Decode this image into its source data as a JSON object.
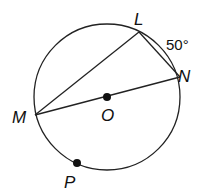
{
  "diagram": {
    "type": "circle-geometry",
    "center": {
      "label": "O",
      "x": 107,
      "y": 97
    },
    "radius": 73,
    "points": [
      {
        "label": "L",
        "x": 139,
        "y": 32
      },
      {
        "label": "N",
        "x": 180,
        "y": 77
      },
      {
        "label": "M",
        "x": 35,
        "y": 115
      },
      {
        "label": "P",
        "x": 77,
        "y": 163
      }
    ],
    "segments": [
      "ML",
      "LN",
      "MN"
    ],
    "arc_label": {
      "arc": "LN",
      "text": "50°"
    },
    "colors": {
      "stroke": "#222222",
      "text": "#111111",
      "background": "#ffffff"
    }
  }
}
